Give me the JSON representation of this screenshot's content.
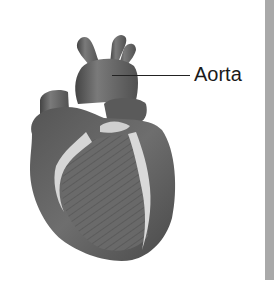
{
  "figure": {
    "labels": [
      {
        "text": "Aorta",
        "target": "aorta"
      }
    ]
  },
  "colors": {
    "background": "#ffffff",
    "heart_dark": "#4a4a4a",
    "heart_mid": "#6b6b6b",
    "heart_light": "#8a8a8a",
    "fat_highlight": "#d9d9d9",
    "side_bar": "#a9a9a9",
    "label_text": "#1a1a1a"
  }
}
